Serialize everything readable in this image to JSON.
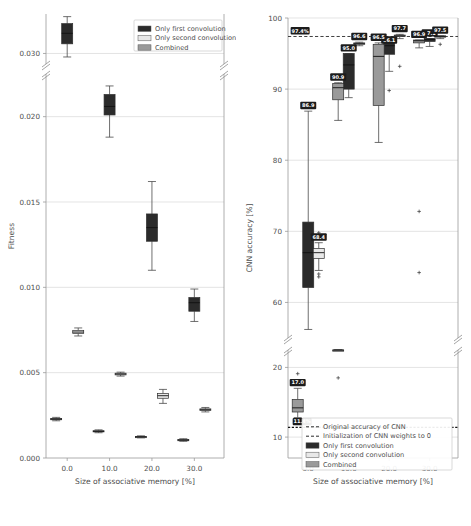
{
  "figure": {
    "width": 471,
    "height": 526,
    "background": "#ffffff"
  },
  "colors": {
    "first_convolution": "#2b2b2b",
    "second_convolution": "#e8e8e8",
    "combined": "#9a9a9a",
    "grid": "#d8d8d8",
    "spine": "#9a9a9a",
    "label_bg": "#1c1c1c",
    "label_fg": "#ffffff"
  },
  "chart_data": [
    {
      "id": "fitness-plot",
      "type": "box",
      "title": "",
      "xlabel": "Size of associative memory [%]",
      "ylabel": "Fitness",
      "grid": true,
      "legend_position": "upper right",
      "broken_yaxis": true,
      "categories": [
        0.0,
        10.0,
        20.0,
        30.0
      ],
      "xticklabels": [
        "0.0",
        "10.0",
        "20.0",
        "30.0"
      ],
      "xlim": [
        -5.0,
        37.0
      ],
      "yticks_upper": [
        0.03
      ],
      "yticks_lower": [
        0.02,
        0.015,
        0.01,
        0.005,
        0.0
      ],
      "yticklabels": [
        "0.030",
        "0.020",
        "0.015",
        "0.010",
        "0.005",
        "0.000"
      ],
      "ylim_upper": [
        0.0288,
        0.0345
      ],
      "ylim_lower": [
        0.0,
        0.0225
      ],
      "legend": [
        {
          "label": "Only first convolution",
          "color": "#2b2b2b"
        },
        {
          "label": "Only second convolution",
          "color": "#e8e8e8"
        },
        {
          "label": "Combined",
          "color": "#9a9a9a"
        }
      ],
      "series": [
        {
          "name": "Only first convolution",
          "color": "#2b2b2b",
          "boxes": [
            {
              "x": 0.0,
              "whisk_lo": 0.0296,
              "q1": 0.0311,
              "median": 0.0323,
              "q3": 0.0334,
              "whisk_hi": 0.0342,
              "fliers": []
            },
            {
              "x": 10.0,
              "whisk_lo": 0.0188,
              "q1": 0.0201,
              "median": 0.0206,
              "q3": 0.0213,
              "whisk_hi": 0.0218,
              "fliers": []
            },
            {
              "x": 20.0,
              "whisk_lo": 0.011,
              "q1": 0.0127,
              "median": 0.0135,
              "q3": 0.0143,
              "whisk_hi": 0.0162,
              "fliers": []
            },
            {
              "x": 30.0,
              "whisk_lo": 0.008,
              "q1": 0.0086,
              "median": 0.0091,
              "q3": 0.0094,
              "whisk_hi": 0.0099,
              "fliers": []
            }
          ]
        },
        {
          "name": "Only second convolution",
          "color": "#e8e8e8",
          "boxes": [
            {
              "x": 2.6,
              "whisk_lo": 0.00715,
              "q1": 0.0073,
              "median": 0.00738,
              "q3": 0.00748,
              "whisk_hi": 0.00762,
              "fliers": []
            },
            {
              "x": 12.6,
              "whisk_lo": 0.0048,
              "q1": 0.00487,
              "median": 0.00492,
              "q3": 0.00497,
              "whisk_hi": 0.00503,
              "fliers": []
            },
            {
              "x": 22.6,
              "whisk_lo": 0.0032,
              "q1": 0.0035,
              "median": 0.00365,
              "q3": 0.00378,
              "whisk_hi": 0.00402,
              "fliers": []
            },
            {
              "x": 32.6,
              "whisk_lo": 0.0027,
              "q1": 0.00278,
              "median": 0.00283,
              "q3": 0.00288,
              "whisk_hi": 0.00296,
              "fliers": []
            }
          ]
        },
        {
          "name": "Combined",
          "color": "#9a9a9a",
          "boxes": [
            {
              "x": -2.6,
              "whisk_lo": 0.00218,
              "q1": 0.00224,
              "median": 0.00228,
              "q3": 0.00232,
              "whisk_hi": 0.00238,
              "fliers": []
            },
            {
              "x": 7.4,
              "whisk_lo": 0.00148,
              "q1": 0.00153,
              "median": 0.00156,
              "q3": 0.0016,
              "whisk_hi": 0.00165,
              "fliers": []
            },
            {
              "x": 17.4,
              "whisk_lo": 0.00118,
              "q1": 0.00122,
              "median": 0.00124,
              "q3": 0.00126,
              "whisk_hi": 0.0013,
              "fliers": []
            },
            {
              "x": 27.4,
              "whisk_lo": 0.00098,
              "q1": 0.00102,
              "median": 0.00105,
              "q3": 0.00108,
              "whisk_hi": 0.00113,
              "fliers": []
            }
          ]
        }
      ]
    },
    {
      "id": "accuracy-plot",
      "type": "box",
      "title": "",
      "xlabel": "Size of associative memory [%]",
      "ylabel": "CNN accuracy [%]",
      "grid": true,
      "legend_position": "lower right",
      "broken_yaxis": true,
      "categories": [
        0.0,
        10.0,
        20.0,
        30.0
      ],
      "xticklabels": [
        "0.0",
        "10.0",
        "20.0",
        "30.0"
      ],
      "xlim": [
        -5.0,
        37.0
      ],
      "yticks_upper": [
        100,
        90,
        80,
        70,
        60
      ],
      "yticks_lower": [
        20,
        10
      ],
      "yticklabels_upper": [
        "100",
        "90",
        "80",
        "70",
        "60"
      ],
      "yticklabels_lower": [
        "20",
        "10"
      ],
      "ylim_upper": [
        55.0,
        100.0
      ],
      "ylim_lower": [
        7.0,
        22.5
      ],
      "reference_lines": [
        {
          "name": "Original accuracy of CNN",
          "value": 97.4,
          "label": "97.4%",
          "style": "dashed"
        },
        {
          "name": "Initialization of CNN weights to 0",
          "value": 11.4,
          "label": "11.4%",
          "style": "dashed"
        }
      ],
      "legend": [
        {
          "label": "Original accuracy of CNN",
          "type": "line",
          "color": "#2b2b2b"
        },
        {
          "label": "Initialization of CNN weights to 0",
          "type": "line",
          "color": "#2b2b2b"
        },
        {
          "label": "Only first convolution",
          "type": "patch",
          "color": "#2b2b2b"
        },
        {
          "label": "Only second convolution",
          "type": "patch",
          "color": "#e8e8e8"
        },
        {
          "label": "Combined",
          "type": "patch",
          "color": "#9a9a9a"
        }
      ],
      "data_labels": [
        "97.4%",
        "86.9",
        "68.4",
        "95.0",
        "96.6",
        "90.9",
        "17.0",
        "96.1",
        "97.7",
        "96.5",
        "97.1",
        "97.5",
        "96.9",
        "11.4%"
      ],
      "series": [
        {
          "name": "Only first convolution",
          "color": "#2b2b2b",
          "boxes": [
            {
              "x": 0.0,
              "whisk_lo": 56.2,
              "q1": 62.1,
              "median": 67.0,
              "q3": 71.3,
              "whisk_hi": 86.9,
              "label": "86.9",
              "fliers": []
            },
            {
              "x": 10.0,
              "whisk_lo": 88.8,
              "q1": 90.0,
              "median": 93.4,
              "q3": 95.0,
              "whisk_hi": 95.0,
              "label": "95.0",
              "fliers": []
            },
            {
              "x": 20.0,
              "whisk_lo": 92.5,
              "q1": 94.9,
              "median": 96.1,
              "q3": 96.6,
              "whisk_hi": 96.1,
              "label": "96.1",
              "fliers": [
                89.8
              ]
            },
            {
              "x": 30.0,
              "whisk_lo": 96.0,
              "q1": 96.7,
              "median": 97.0,
              "q3": 97.1,
              "whisk_hi": 97.1,
              "label": "97.1",
              "fliers": []
            }
          ]
        },
        {
          "name": "Only second convolution",
          "color": "#e8e8e8",
          "boxes": [
            {
              "x": 2.6,
              "whisk_lo": 64.5,
              "q1": 66.2,
              "median": 67.0,
              "q3": 67.6,
              "whisk_hi": 68.4,
              "label": "68.4",
              "fliers": [
                69.8,
                64.0,
                63.6
              ]
            },
            {
              "x": 12.6,
              "whisk_lo": 96.1,
              "q1": 96.3,
              "median": 96.4,
              "q3": 96.5,
              "whisk_hi": 96.6,
              "label": "96.6",
              "fliers": []
            },
            {
              "x": 22.6,
              "whisk_lo": 97.1,
              "q1": 97.4,
              "median": 97.5,
              "q3": 97.6,
              "whisk_hi": 97.7,
              "label": "97.7",
              "fliers": [
                93.2
              ]
            },
            {
              "x": 32.6,
              "whisk_lo": 97.1,
              "q1": 97.3,
              "median": 97.4,
              "q3": 97.5,
              "whisk_hi": 97.5,
              "label": "97.5",
              "fliers": [
                96.3
              ]
            }
          ]
        },
        {
          "name": "Combined",
          "color": "#9a9a9a",
          "boxes": [
            {
              "x": -2.6,
              "whisk_lo": 12.8,
              "q1": 13.6,
              "median": 14.2,
              "q3": 15.4,
              "whisk_hi": 17.0,
              "label": "17.0",
              "fliers": [
                19.1
              ]
            },
            {
              "x": 7.4,
              "whisk_lo": 85.6,
              "q1": 88.5,
              "median": 90.2,
              "q3": 90.8,
              "whisk_hi": 90.9,
              "label": "90.9",
              "fliers": [
                18.5
              ]
            },
            {
              "x": 17.4,
              "whisk_lo": 82.5,
              "q1": 87.7,
              "median": 94.6,
              "q3": 96.3,
              "whisk_hi": 96.5,
              "label": "96.5",
              "fliers": []
            },
            {
              "x": 27.4,
              "whisk_lo": 95.8,
              "q1": 96.5,
              "median": 96.8,
              "q3": 96.9,
              "whisk_hi": 96.9,
              "label": "96.9",
              "fliers": [
                72.8,
                64.2
              ]
            }
          ]
        }
      ]
    }
  ]
}
